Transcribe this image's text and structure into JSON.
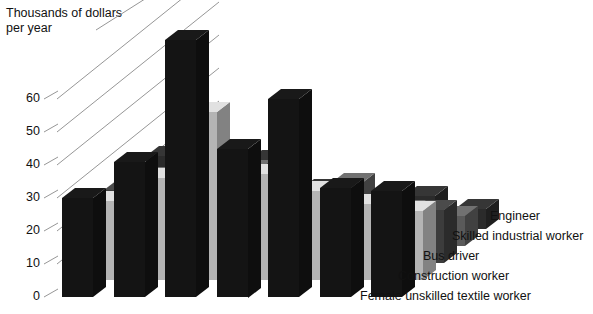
{
  "chart_data": {
    "type": "bar",
    "title": "Thousands of dollars per year",
    "clipped_title": "",
    "xlabel": "",
    "ylabel": "Thousands of dollars per year",
    "ylim": [
      0,
      80
    ],
    "yticks": [
      0,
      10,
      20,
      30,
      40,
      50,
      60
    ],
    "ytick_labels": [
      "0",
      "10",
      "20",
      "30",
      "40",
      "50",
      "60"
    ],
    "grid": true,
    "grid_style": "diagonal-3d-perspective",
    "legend_position": "right",
    "projection": "3d-grouped-depth",
    "categories": [
      "C1",
      "C2",
      "C3",
      "C4",
      "C5",
      "C6",
      "C7"
    ],
    "category_labels_visible": false,
    "series": [
      {
        "name": "Engineer",
        "color": "#141414",
        "values": [
          30,
          41,
          78,
          45,
          60,
          33,
          32
        ]
      },
      {
        "name": "Skilled industrial worker",
        "color": "#b4b4b4",
        "values": [
          24,
          31,
          51,
          32,
          27,
          23,
          21
        ]
      },
      {
        "name": "Bus driver",
        "color": "#3c3c3c",
        "values": [
          22,
          26,
          25,
          22,
          20,
          18,
          16
        ]
      },
      {
        "name": "Construction worker",
        "color": "#5a5a5a",
        "values": [
          21,
          24,
          23,
          12,
          19,
          11,
          9
        ]
      },
      {
        "name": "Female unskilled textile worker",
        "color": "#2b2b2b",
        "values": [
          22,
          21,
          21,
          12,
          7,
          10,
          6
        ]
      }
    ]
  },
  "axis": {
    "title_line1": "Thousands of dollars",
    "title_line2": "per year"
  },
  "legend": {
    "items": [
      {
        "label": "Engineer"
      },
      {
        "label": "Skilled industrial worker"
      },
      {
        "label": "Bus driver"
      },
      {
        "label": "Construction worker"
      },
      {
        "label": "Female unskilled textile worker"
      }
    ]
  }
}
